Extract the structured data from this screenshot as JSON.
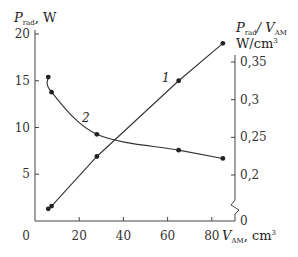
{
  "chart_data": {
    "type": "line",
    "title": "",
    "xlabel": "V_AM, cm³",
    "ylabel_left": "P_rad, W",
    "ylabel_right": "P_rad / V_AM W/cm³",
    "xlim": [
      0,
      90
    ],
    "ylim_left": [
      0,
      20
    ],
    "ylim_right_ticks": [
      0,
      0.2,
      0.25,
      0.3,
      0.35
    ],
    "right_axis_break": true,
    "grid": false,
    "x_ticks": [
      "0",
      "20",
      "40",
      "60",
      "80"
    ],
    "y_left_ticks": [
      "5",
      "10",
      "15",
      "20"
    ],
    "y_right_ticks": [
      "0",
      "0,2",
      "0,25",
      "0,3",
      "0,35"
    ],
    "series": [
      {
        "name": "1",
        "axis": "left",
        "x": [
          6,
          7.5,
          28,
          65,
          85
        ],
        "y": [
          1.3,
          1.6,
          6.9,
          15.0,
          19.0
        ]
      },
      {
        "name": "2",
        "axis": "right",
        "x": [
          6,
          7.5,
          28,
          65,
          85
        ],
        "y": [
          0.33,
          0.31,
          0.254,
          0.233,
          0.222
        ]
      }
    ]
  },
  "labels": {
    "y_left_main": "P",
    "y_left_sub": "rad",
    "y_left_unit": ", W",
    "y_right_p": "P",
    "y_right_p_sub": "rad",
    "y_right_slash": "/ V",
    "y_right_v_sub": "AM",
    "y_right_unit": "W/cm",
    "y_right_unit_sup": "3",
    "x_main": "V",
    "x_sub": "AM",
    "x_unit": ", cm",
    "x_unit_sup": "3",
    "curve1": "1",
    "curve2": "2"
  }
}
